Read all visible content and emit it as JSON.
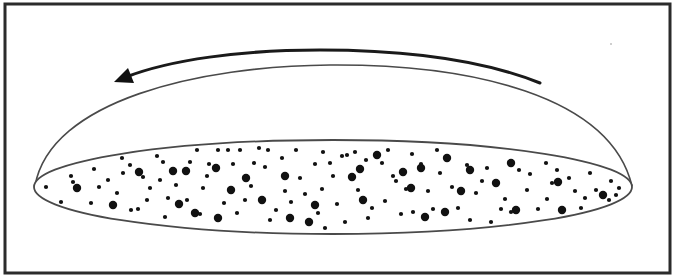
{
  "figure": {
    "description": "Flattened rotating disk of stars (galaxy disk) beneath a dome-shaped halo, with a curved arrow indicating rotation direction",
    "rotation_direction": "counterclockwise (arrow pointing left)",
    "colors": {
      "background": "#ffffff",
      "frame": "#2b2b2b",
      "outline": "#4a4a4a",
      "stars": "#111111",
      "arrow": "#1a1a1a"
    },
    "elements": {
      "frame": "border-frame",
      "dome": "halo-dome-outline",
      "disk": "star-disk-ellipse",
      "arrow": "rotation-arrow",
      "stars": "star-dots"
    },
    "star_counts": {
      "large": 34,
      "small": 120
    }
  }
}
